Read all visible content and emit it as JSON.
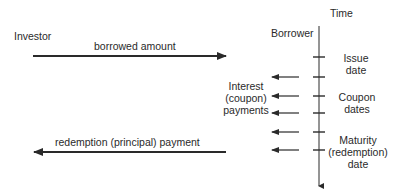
{
  "diagram": {
    "parties": {
      "investor": "Investor",
      "borrower": "Borrower"
    },
    "axis_label": "Time",
    "flows": {
      "borrowed": "borrowed amount",
      "redemption": "redemption (principal) payment",
      "interest": [
        "Interest",
        "(coupon)",
        "payments"
      ]
    },
    "dates": {
      "issue": [
        "Issue",
        "date"
      ],
      "coupon": [
        "Coupon",
        "dates"
      ],
      "maturity": [
        "Maturity",
        "(redemption)",
        "date"
      ]
    },
    "colors": {
      "line": "#2a2a2a",
      "background": "#ffffff"
    }
  }
}
